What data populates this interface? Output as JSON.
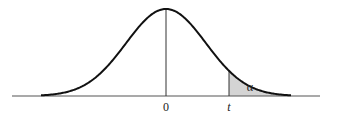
{
  "diagram": {
    "type": "t-distribution right-tail area",
    "curve": {
      "shape": "bell",
      "peak_x_label": "0",
      "color": "#111111"
    },
    "shaded_region": {
      "label": "α",
      "start_label": "t",
      "fill_color": "#d4d4d4"
    },
    "axis": {
      "color": "#555555",
      "tick_labels": [
        "0",
        "t"
      ]
    }
  },
  "labels": {
    "zero": "0",
    "t": "t",
    "alpha": "α"
  }
}
